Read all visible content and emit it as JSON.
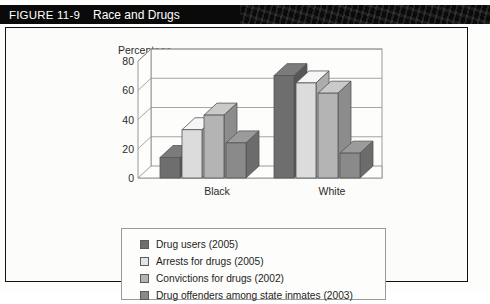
{
  "banner": {
    "figure_number": "FIGURE 11-9",
    "title": "Race and Drugs"
  },
  "chart_data": {
    "type": "bar",
    "title": "Race and Drugs",
    "xlabel": "",
    "ylabel": "Percentage",
    "ylim": [
      0,
      80
    ],
    "yticks": [
      0,
      20,
      40,
      60,
      80
    ],
    "ytick_labels": [
      "0",
      "20",
      "40",
      "60",
      "80"
    ],
    "grid": true,
    "legend_position": "bottom",
    "categories": [
      "Black",
      "White"
    ],
    "series": [
      {
        "name": "Drug users (2005)",
        "values": [
          14,
          70
        ],
        "color": "#6e6e6e"
      },
      {
        "name": "Arrests for drugs (2005)",
        "values": [
          33,
          65
        ],
        "color": "#dcdcdc"
      },
      {
        "name": "Convictions for drugs (2002)",
        "values": [
          43,
          58
        ],
        "color": "#b4b4b4"
      },
      {
        "name": "Drug offenders among state inmates (2003)",
        "values": [
          24,
          17
        ],
        "color": "#8a8a8a"
      }
    ]
  },
  "legend": {
    "items": [
      {
        "label": "Drug users (2005)",
        "color": "#6e6e6e"
      },
      {
        "label": "Arrests for drugs (2005)",
        "color": "#e4e4e4"
      },
      {
        "label": "Convictions for drugs (2002)",
        "color": "#b4b4b4"
      },
      {
        "label": "Drug offenders among state inmates (2003)",
        "color": "#8a8a8a"
      }
    ]
  },
  "axis": {
    "y_title": "Percentage",
    "x_labels": [
      "Black",
      "White"
    ],
    "y_labels": [
      "80",
      "60",
      "40",
      "20",
      "0"
    ]
  }
}
